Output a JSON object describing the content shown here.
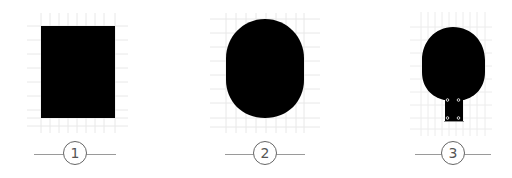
{
  "figure": {
    "background": "#ffffff",
    "shape_color": "#000000",
    "grid_color": "#e6e6e6",
    "panels": [
      {
        "label": "1",
        "shape": "rectangle"
      },
      {
        "label": "2",
        "shape": "rounded-oval"
      },
      {
        "label": "3",
        "shape": "paddle-with-connector-tab"
      }
    ]
  }
}
